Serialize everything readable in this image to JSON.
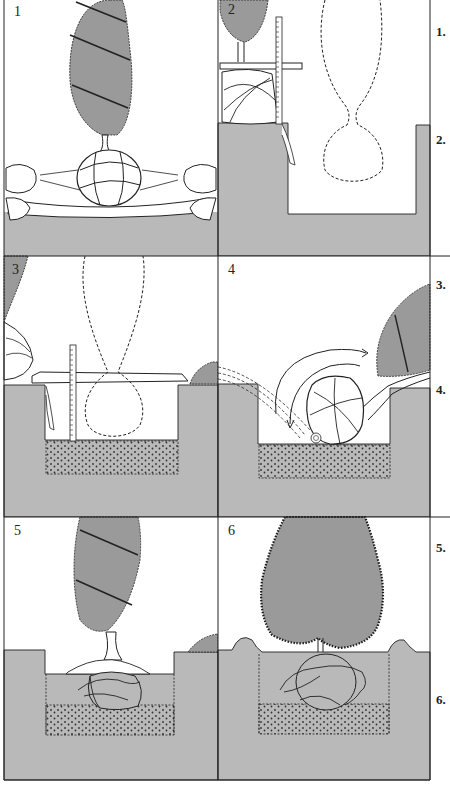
{
  "figure": {
    "colors": {
      "soil": "#b9b9b9",
      "foliage": "#9a9a9a",
      "ink": "#1f1f1f",
      "paper": "#ffffff"
    },
    "panels": [
      {
        "number": "1",
        "description": "Root ball wrapped in burlap lifted onto a sheet by two pairs of hands; conical tree wound with ties"
      },
      {
        "number": "2",
        "description": "Measuring depth of root ball with a ruler and straight board; dashed outline of tree shows position in prepared hole"
      },
      {
        "number": "3",
        "description": "Board laid across hole and ruler measures depth to bed of loose soil; dashed outline of plant in hole"
      },
      {
        "number": "4",
        "description": "Tree tipped and rolled into the hole along the arrow; burlap unrolled at bottom"
      },
      {
        "number": "5",
        "description": "Tree standing upright in hole; burlap loosened around root ball over loose soil"
      },
      {
        "number": "6",
        "description": "Hole backfilled with soil ridge around the edge; ties removed and tree fully grown out"
      }
    ],
    "step_markers": [
      "1.",
      "2.",
      "3.",
      "4.",
      "5.",
      "6."
    ]
  }
}
